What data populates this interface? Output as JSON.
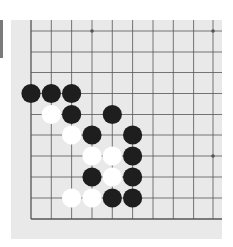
{
  "board": {
    "description": "Go board corner diagram (bottom-left corner shown, 10 columns x 10 rows visible)",
    "colors": {
      "board": "#e9e9e9",
      "line": "#555555",
      "black_stone": "#1e1e1e",
      "white_stone": "#ffffff",
      "side_bar": "#7a7a7a"
    },
    "grid": {
      "x": [
        31,
        51.3,
        71.6,
        92,
        112.3,
        132.6,
        153,
        173.3,
        193.6,
        213
      ],
      "y": [
        31,
        52,
        72.5,
        93.5,
        114.5,
        135,
        156,
        177,
        198,
        219
      ],
      "edges": {
        "left": true,
        "bottom": true,
        "top": false,
        "right": false
      }
    },
    "star_points": [
      {
        "col": 3,
        "row": 0
      },
      {
        "col": 9,
        "row": 0
      },
      {
        "col": 9,
        "row": 6
      }
    ],
    "stones": [
      {
        "color": "black",
        "col": 0,
        "row": 3
      },
      {
        "color": "black",
        "col": 1,
        "row": 3
      },
      {
        "color": "black",
        "col": 2,
        "row": 3
      },
      {
        "color": "white",
        "col": 1,
        "row": 4
      },
      {
        "color": "black",
        "col": 2,
        "row": 4
      },
      {
        "color": "black",
        "col": 4,
        "row": 4
      },
      {
        "color": "white",
        "col": 2,
        "row": 5
      },
      {
        "color": "black",
        "col": 3,
        "row": 5
      },
      {
        "color": "black",
        "col": 5,
        "row": 5
      },
      {
        "color": "white",
        "col": 3,
        "row": 6
      },
      {
        "color": "white",
        "col": 4,
        "row": 6
      },
      {
        "color": "black",
        "col": 5,
        "row": 6
      },
      {
        "color": "black",
        "col": 3,
        "row": 7
      },
      {
        "color": "white",
        "col": 4,
        "row": 7
      },
      {
        "color": "black",
        "col": 5,
        "row": 7
      },
      {
        "color": "white",
        "col": 2,
        "row": 8
      },
      {
        "color": "white",
        "col": 3,
        "row": 8
      },
      {
        "color": "black",
        "col": 4,
        "row": 8
      },
      {
        "color": "black",
        "col": 5,
        "row": 8
      }
    ]
  }
}
